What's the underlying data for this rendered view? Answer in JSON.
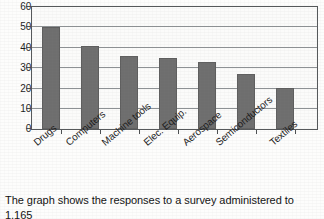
{
  "chart_data": {
    "type": "bar",
    "title": "",
    "subtitle": "",
    "xlabel": "",
    "ylabel": "",
    "categories": [
      "Drugs",
      "Computers",
      "Machine tools",
      "Elec. Equip.",
      "Aerospace",
      "Semiconductors",
      "Textiles"
    ],
    "values": [
      50,
      41,
      36,
      35,
      33,
      27,
      20
    ],
    "ylim": [
      0,
      60
    ],
    "yticks": [
      0,
      10,
      20,
      30,
      40,
      50,
      60
    ],
    "ytick_labels": [
      "0",
      "10",
      "20",
      "30",
      "40",
      "50",
      "60"
    ],
    "grid": true,
    "legend": false,
    "legend_position": "none",
    "bar_color": "#6e6e6e",
    "axis_color": "#55585a",
    "gridline_color": "#8d9194",
    "annotations": []
  },
  "caption": {
    "line1": "The graph shows the responses to a survey administered to 1,165",
    "line2": "adults who stated that they are changing their jobs. (%) The answers sum"
  }
}
